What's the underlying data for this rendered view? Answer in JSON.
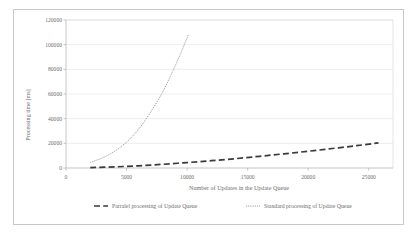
{
  "chart_data": {
    "type": "line",
    "title": "",
    "xlabel": "Number of Updates in the Update Queue",
    "ylabel": "Processing time [ms]",
    "xlim": [
      0,
      27000
    ],
    "ylim": [
      0,
      120000
    ],
    "xticks": [
      0,
      5000,
      10000,
      15000,
      20000,
      25000
    ],
    "xtick_labels": [
      "0",
      "5000",
      "10000",
      "15000",
      "20000",
      "25000"
    ],
    "yticks": [
      0,
      20000,
      40000,
      60000,
      80000,
      100000,
      120000
    ],
    "ytick_labels": [
      "0",
      "20000",
      "40000",
      "60000",
      "80000",
      "100000",
      "120000"
    ],
    "grid": "horizontal",
    "legend_position": "bottom",
    "series": [
      {
        "name": "Parralel processing of Update Queue",
        "style": "dashed",
        "color": "#3a3a3a",
        "points": [
          [
            2000,
            300
          ],
          [
            4000,
            900
          ],
          [
            6000,
            1800
          ],
          [
            8000,
            3000
          ],
          [
            10000,
            4400
          ],
          [
            12000,
            5900
          ],
          [
            14000,
            7600
          ],
          [
            16000,
            9500
          ],
          [
            18000,
            11500
          ],
          [
            20000,
            13600
          ],
          [
            22000,
            15800
          ],
          [
            24000,
            18100
          ],
          [
            25800,
            20400
          ]
        ]
      },
      {
        "name": "Standard processing of Update Queue",
        "style": "dotted",
        "color": "#8a8a8a",
        "points": [
          [
            2000,
            4500
          ],
          [
            3000,
            8200
          ],
          [
            4000,
            13500
          ],
          [
            5000,
            21000
          ],
          [
            6000,
            31500
          ],
          [
            7000,
            45500
          ],
          [
            8000,
            62000
          ],
          [
            9000,
            82500
          ],
          [
            9600,
            96000
          ],
          [
            10100,
            108000
          ]
        ]
      }
    ]
  },
  "legend": {
    "items": [
      {
        "label": "Parralel processing of Update Queue"
      },
      {
        "label": "Standard processing of Update Queue"
      }
    ]
  }
}
